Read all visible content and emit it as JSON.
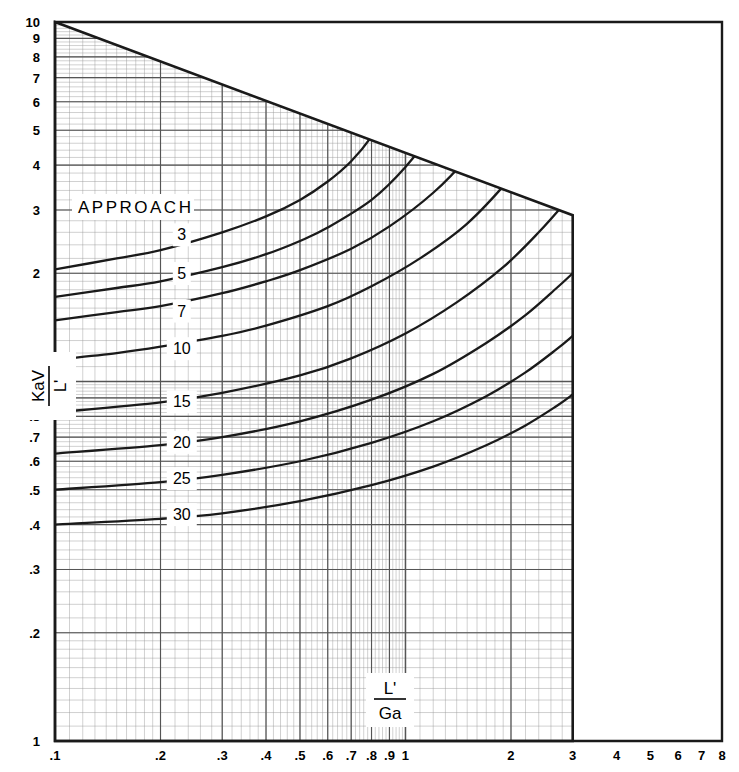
{
  "chart_data": {
    "type": "line",
    "title": "",
    "xlabel": "L'/Ga",
    "xlabel_numerator": "L'",
    "xlabel_denominator": "Ga",
    "ylabel": "KaV/L'",
    "ylabel_numerator": "KaV",
    "ylabel_denominator": "L'",
    "xscale": "log",
    "yscale": "log",
    "xlim": [
      0.1,
      8
    ],
    "ylim": [
      0.1,
      10
    ],
    "grid": true,
    "grid_style": "log-log graph paper, minor rulings",
    "legend_position": "inline-curve-labels",
    "series_group_title": "APPROACH",
    "x_ticks": [
      ".1",
      ".2",
      ".3",
      ".4",
      ".5",
      ".6",
      ".7",
      ".8",
      ".9",
      "1",
      "2",
      "3",
      "4",
      "5",
      "6",
      "7",
      "8"
    ],
    "x_tick_values": [
      0.1,
      0.2,
      0.3,
      0.4,
      0.5,
      0.6,
      0.7,
      0.8,
      0.9,
      1,
      2,
      3,
      4,
      5,
      6,
      7,
      8
    ],
    "y_ticks": [
      "1",
      "2",
      "3",
      "4",
      "5",
      "6",
      "7",
      "8",
      "9",
      "10"
    ],
    "y_tick_values_upper": [
      1,
      2,
      3,
      4,
      5,
      6,
      7,
      8,
      9,
      10
    ],
    "y_ticks_lower": [
      "1",
      ".2",
      ".3",
      ".4",
      ".5",
      ".6",
      ".7",
      ".8",
      ".9",
      "1"
    ],
    "y_tick_values_lower": [
      0.1,
      0.2,
      0.3,
      0.4,
      0.5,
      0.6,
      0.7,
      0.8,
      0.9,
      1
    ],
    "series": [
      {
        "name": "3",
        "label": "3",
        "x": [
          0.1,
          0.15,
          0.2,
          0.3,
          0.4,
          0.5,
          0.6,
          0.7,
          0.8,
          0.9,
          1.0,
          1.1
        ],
        "values": [
          2.05,
          2.2,
          2.32,
          2.6,
          2.88,
          3.2,
          3.6,
          4.1,
          4.8,
          5.8,
          7.4,
          9.6
        ]
      },
      {
        "name": "5",
        "label": "5",
        "x": [
          0.1,
          0.15,
          0.2,
          0.3,
          0.4,
          0.5,
          0.6,
          0.8,
          1.0,
          1.2,
          1.4,
          1.5
        ],
        "values": [
          1.72,
          1.82,
          1.9,
          2.08,
          2.26,
          2.46,
          2.68,
          3.2,
          3.95,
          5.0,
          6.6,
          7.7
        ]
      },
      {
        "name": "7",
        "label": "7",
        "x": [
          0.1,
          0.15,
          0.2,
          0.3,
          0.4,
          0.5,
          0.7,
          0.9,
          1.2,
          1.5,
          1.8,
          2.0
        ],
        "values": [
          1.48,
          1.56,
          1.62,
          1.76,
          1.9,
          2.04,
          2.34,
          2.7,
          3.35,
          4.2,
          5.4,
          6.4
        ]
      },
      {
        "name": "10",
        "label": "10",
        "x": [
          0.1,
          0.15,
          0.2,
          0.3,
          0.4,
          0.6,
          0.8,
          1.1,
          1.5,
          2.0,
          2.4,
          2.6
        ],
        "values": [
          1.15,
          1.2,
          1.25,
          1.34,
          1.43,
          1.62,
          1.84,
          2.2,
          2.75,
          3.7,
          4.7,
          5.3
        ]
      },
      {
        "name": "15",
        "label": "15",
        "x": [
          0.1,
          0.2,
          0.3,
          0.5,
          0.7,
          1.0,
          1.4,
          1.9,
          2.4,
          2.9,
          3.0
        ],
        "values": [
          0.82,
          0.875,
          0.93,
          1.04,
          1.16,
          1.36,
          1.66,
          2.08,
          2.6,
          3.2,
          3.35
        ]
      },
      {
        "name": "20",
        "label": "20",
        "x": [
          0.1,
          0.2,
          0.3,
          0.5,
          0.8,
          1.2,
          1.7,
          2.2,
          2.7,
          3.0
        ],
        "values": [
          0.63,
          0.665,
          0.7,
          0.775,
          0.89,
          1.05,
          1.28,
          1.53,
          1.82,
          2.0
        ]
      },
      {
        "name": "25",
        "label": "25",
        "x": [
          0.1,
          0.2,
          0.3,
          0.5,
          0.8,
          1.2,
          1.7,
          2.2,
          2.7,
          3.0
        ],
        "values": [
          0.5,
          0.525,
          0.55,
          0.6,
          0.675,
          0.775,
          0.91,
          1.06,
          1.23,
          1.34
        ]
      },
      {
        "name": "30",
        "label": "30",
        "x": [
          0.1,
          0.2,
          0.3,
          0.5,
          0.8,
          1.2,
          1.7,
          2.2,
          2.7,
          3.0
        ],
        "values": [
          0.4,
          0.415,
          0.43,
          0.465,
          0.515,
          0.58,
          0.665,
          0.755,
          0.855,
          0.92
        ]
      }
    ],
    "curve_label_positions": [
      {
        "label": "3",
        "x": 0.23,
        "y": 2.55
      },
      {
        "label": "5",
        "x": 0.23,
        "y": 1.99
      },
      {
        "label": "7",
        "x": 0.23,
        "y": 1.565
      },
      {
        "label": "10",
        "x": 0.23,
        "y": 1.23
      },
      {
        "label": "15",
        "x": 0.23,
        "y": 0.875
      },
      {
        "label": "20",
        "x": 0.23,
        "y": 0.675
      },
      {
        "label": "25",
        "x": 0.23,
        "y": 0.535
      },
      {
        "label": "30",
        "x": 0.23,
        "y": 0.425
      }
    ],
    "boundary": {
      "description": "grid paper region bounded by diagonal upper edge and vertical right edge",
      "top_left": {
        "x": 0.1,
        "y": 10
      },
      "diagonal_end": {
        "x": 3.0,
        "y": 2.9
      },
      "right_edge_x": 3.0
    },
    "colors": {
      "background": "#ffffff",
      "axis": "#1a1a1a",
      "curve": "#1a1a1a",
      "grid_major": "#555555",
      "grid_minor": "#999999",
      "label_box": "#ffffff"
    }
  },
  "annotations": {
    "approach_title": "APPROACH"
  }
}
